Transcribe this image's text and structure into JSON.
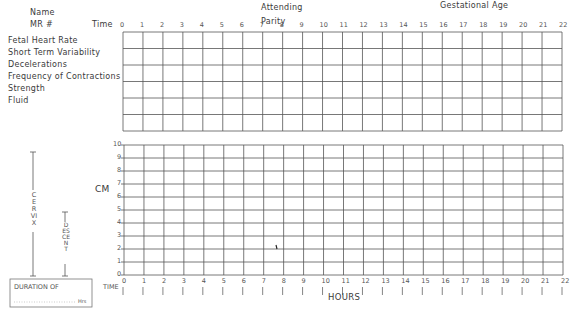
{
  "header": {
    "name_label": "Name",
    "mr_label": "MR #",
    "attending_label": "Attending",
    "parity_label": "Parity",
    "gestational_age_label": "Gestational Age"
  },
  "monitor_section": {
    "time_label": "Time",
    "time_ticks": [
      "0",
      "1",
      "2",
      "3",
      "4",
      "5",
      "6",
      "7",
      "8",
      "9",
      "10",
      "11",
      "12",
      "13",
      "14",
      "15",
      "16",
      "17",
      "18",
      "19",
      "20",
      "21",
      "22"
    ],
    "rows": [
      "Fetal Heart Rate",
      "Short Term Variability",
      "Decelerations",
      "Frequency of Contractions",
      "Strength",
      "Fluid"
    ]
  },
  "labor_curve": {
    "y_axis_label": "CM",
    "y_ticks": [
      "10",
      "9",
      "8",
      "7",
      "6",
      "5",
      "4",
      "3",
      "2",
      "1",
      "0"
    ],
    "x_ticks": [
      "0",
      "1",
      "2",
      "3",
      "4",
      "5",
      "6",
      "7",
      "8",
      "9",
      "10",
      "11",
      "12",
      "13",
      "14",
      "15",
      "16",
      "17",
      "18",
      "19",
      "20",
      "21",
      "22"
    ],
    "x_row_label": "TIME",
    "x_axis_label": "HOURS",
    "cervix_label": "CERVIX",
    "descent_label": "DESCENT",
    "duration_label": "DURATION OF",
    "hrs_label": "Hrs"
  },
  "chart_data": {
    "type": "line",
    "xlabel": "HOURS",
    "ylabel": "CM",
    "x": [
      0,
      1,
      2,
      3,
      4,
      5,
      6,
      7,
      8,
      9,
      10,
      11,
      12,
      13,
      14,
      15,
      16,
      17,
      18,
      19,
      20,
      21,
      22
    ],
    "xlim": [
      0,
      22
    ],
    "ylim": [
      0,
      10
    ],
    "grid": true,
    "series": []
  }
}
